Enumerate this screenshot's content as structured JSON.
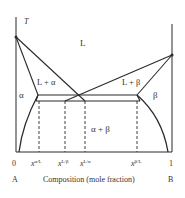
{
  "diagram": {
    "type": "binary eutectic phase diagram",
    "axis": {
      "y_label": "T",
      "x_label": "Composition (mole fraction)",
      "x_min_tick": "0",
      "x_max_tick": "1",
      "left_component": "A",
      "right_component": "B"
    },
    "regions": {
      "liquid": "L",
      "liquid_alpha": "L + α",
      "liquid_beta": "L + β",
      "alpha": "α",
      "beta": "β",
      "alpha_beta": "α + β"
    },
    "composition_marks": [
      {
        "base": "x",
        "sup": "α/L"
      },
      {
        "base": "x",
        "sup": "L/β"
      },
      {
        "base": "x",
        "sup": "L/α"
      },
      {
        "base": "x",
        "sup": "β/L"
      }
    ],
    "colors": {
      "line": "#2a2a2a",
      "background": "#ffffff"
    }
  }
}
